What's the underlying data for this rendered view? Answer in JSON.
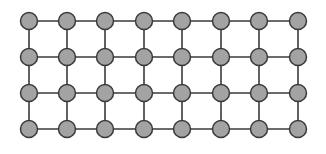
{
  "diagram": {
    "type": "grid-graph",
    "rows": 4,
    "cols": 8,
    "column_x": [
      29,
      67,
      105,
      144,
      182,
      221,
      259,
      298
    ],
    "row_y": [
      21,
      57,
      93,
      129
    ],
    "node_radius": 8.5,
    "colors": {
      "node_fill": "#a3a3a3",
      "node_stroke": "#3a3a3a",
      "edge": "#3a3a3a",
      "background": "#ffffff"
    },
    "connectivity": "4-neighbor lattice (horizontal and vertical edges)"
  }
}
